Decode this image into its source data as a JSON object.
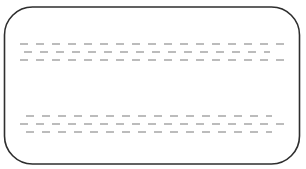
{
  "diagram": {
    "frame": {
      "shape": "rounded-rectangle",
      "x": 4.5,
      "y": 7,
      "width": 295,
      "height": 157,
      "radius": 28,
      "stroke": "#2e2e2e",
      "stroke_width": 1.6,
      "fill": "#ffffff"
    },
    "dash_style": {
      "color": "#7a7a7a",
      "dash_length": 8,
      "gap": 8,
      "stroke_width": 1.1
    },
    "groups": [
      {
        "name": "upper-dashed-lines",
        "rows": [
          {
            "y": 44,
            "x_start": 20,
            "x_end": 288,
            "offset": 0
          },
          {
            "y": 52,
            "x_start": 24,
            "x_end": 270,
            "offset": 0
          },
          {
            "y": 60,
            "x_start": 20,
            "x_end": 284,
            "offset": 0
          }
        ]
      },
      {
        "name": "lower-dashed-lines",
        "rows": [
          {
            "y": 116,
            "x_start": 26,
            "x_end": 272,
            "offset": 0
          },
          {
            "y": 124,
            "x_start": 20,
            "x_end": 286,
            "offset": 0
          },
          {
            "y": 132,
            "x_start": 26,
            "x_end": 272,
            "offset": 0
          }
        ]
      }
    ]
  }
}
